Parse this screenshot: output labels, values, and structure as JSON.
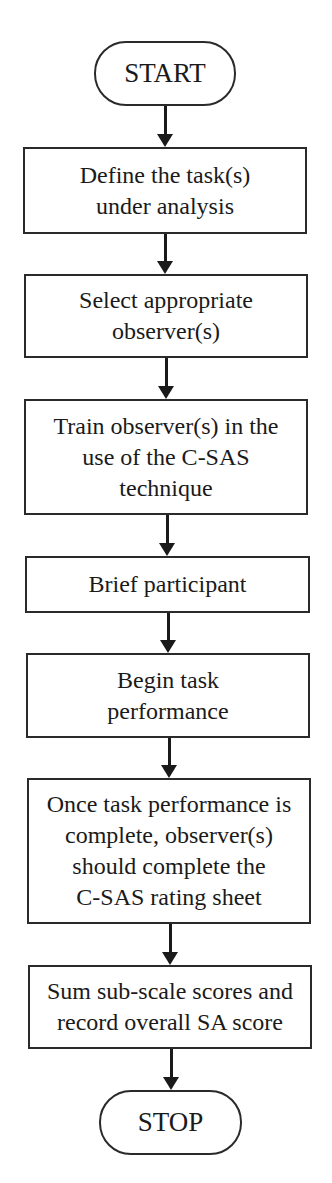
{
  "flowchart": {
    "start": {
      "label": "START"
    },
    "steps": [
      {
        "label": "Define the task(s)\nunder analysis"
      },
      {
        "label": "Select appropriate\nobserver(s)"
      },
      {
        "label": "Train observer(s) in the\nuse of the C-SAS\ntechnique"
      },
      {
        "label": "Brief participant"
      },
      {
        "label": "Begin task\nperformance"
      },
      {
        "label": "Once task performance is\ncomplete, observer(s)\nshould complete the\nC-SAS rating sheet"
      },
      {
        "label": "Sum sub-scale scores and\nrecord overall SA score"
      }
    ],
    "stop": {
      "label": "STOP"
    }
  }
}
